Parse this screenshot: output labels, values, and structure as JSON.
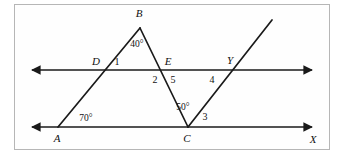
{
  "figure": {
    "stroke_color": "#1a1a1a",
    "frame_color": "#b6b6b6",
    "background": "#ffffff"
  },
  "points": [
    {
      "id": "A",
      "label": "A",
      "x": 57,
      "y": 138,
      "style": "italic"
    },
    {
      "id": "B",
      "label": "B",
      "x": 139,
      "y": 13,
      "style": "italic"
    },
    {
      "id": "C",
      "label": "C",
      "x": 187,
      "y": 138,
      "style": "italic"
    },
    {
      "id": "D",
      "label": "D",
      "x": 96,
      "y": 61,
      "style": "italic"
    },
    {
      "id": "E",
      "label": "E",
      "x": 168,
      "y": 61,
      "style": "italic"
    },
    {
      "id": "Y",
      "label": "Y",
      "x": 230,
      "y": 60,
      "style": "italic"
    },
    {
      "id": "X",
      "label": "X",
      "x": 313,
      "y": 139,
      "style": "italic"
    }
  ],
  "angle_measures": [
    {
      "id": "angle-40",
      "label": "40°",
      "x": 137,
      "y": 45,
      "vertex": "B"
    },
    {
      "id": "angle-70",
      "label": "70°",
      "x": 86,
      "y": 119,
      "vertex": "A"
    },
    {
      "id": "angle-50",
      "label": "50°",
      "x": 183,
      "y": 108,
      "vertex": "C"
    }
  ],
  "angle_numbers": [
    {
      "id": "angle-1",
      "label": "1",
      "x": 117,
      "y": 62
    },
    {
      "id": "angle-2",
      "label": "2",
      "x": 155,
      "y": 80
    },
    {
      "id": "angle-5",
      "label": "5",
      "x": 173,
      "y": 80
    },
    {
      "id": "angle-4",
      "label": "4",
      "x": 212,
      "y": 80
    },
    {
      "id": "angle-3",
      "label": "3",
      "x": 205,
      "y": 117
    }
  ],
  "lines": [
    {
      "id": "upper-parallel-line",
      "from": [
        29,
        70
      ],
      "to": [
        315,
        70
      ],
      "arrows": "both"
    },
    {
      "id": "lower-parallel-line",
      "from": [
        29,
        127
      ],
      "to": [
        315,
        127
      ],
      "arrows": "both"
    },
    {
      "id": "segment-AB",
      "from": [
        58,
        127
      ],
      "to": [
        140,
        28
      ],
      "arrows": "none"
    },
    {
      "id": "segment-BC",
      "from": [
        140,
        28
      ],
      "to": [
        188,
        127
      ],
      "arrows": "none"
    },
    {
      "id": "ray-CY",
      "from": [
        188,
        127
      ],
      "to": [
        272,
        20
      ],
      "arrows": "none"
    }
  ]
}
